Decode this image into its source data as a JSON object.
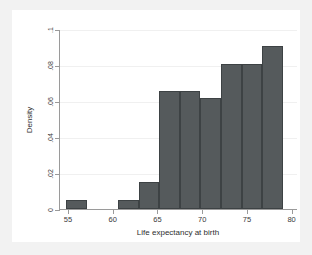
{
  "figure": {
    "background_color": "#f2f2f2",
    "plot_background_color": "#ffffff",
    "bar_color": "#555a5c",
    "bar_border_color": "#3d4244",
    "axis_color": "#9a9a9a",
    "grid_color": "#f0f0f0"
  },
  "chart_data": {
    "type": "bar",
    "title": "",
    "subtitle": "",
    "xlabel": "Life expectancy at birth",
    "ylabel": "Density",
    "xlim": [
      54.0,
      80.6
    ],
    "ylim": [
      0,
      0.1
    ],
    "grid": true,
    "legend": null,
    "legend_position": "none",
    "bin_width": 2.3,
    "xticks": [
      55,
      60,
      65,
      70,
      75,
      80
    ],
    "xtick_labels": [
      "55",
      "60",
      "65",
      "70",
      "75",
      "80"
    ],
    "yticks": [
      0,
      0.02,
      0.04,
      0.06,
      0.08,
      0.1
    ],
    "ytick_labels": [
      "0",
      ".02",
      ".04",
      ".06",
      ".08",
      ".1"
    ],
    "bars": [
      {
        "x_start": 54.8,
        "x_end": 57.1,
        "value": 0.005
      },
      {
        "x_start": 60.6,
        "x_end": 62.9,
        "value": 0.005
      },
      {
        "x_start": 62.9,
        "x_end": 65.2,
        "value": 0.015
      },
      {
        "x_start": 65.2,
        "x_end": 67.5,
        "value": 0.0655
      },
      {
        "x_start": 67.5,
        "x_end": 69.8,
        "value": 0.0655
      },
      {
        "x_start": 69.8,
        "x_end": 72.1,
        "value": 0.0615
      },
      {
        "x_start": 72.1,
        "x_end": 74.4,
        "value": 0.0805
      },
      {
        "x_start": 74.4,
        "x_end": 76.7,
        "value": 0.0805
      },
      {
        "x_start": 76.7,
        "x_end": 79.0,
        "value": 0.0905
      }
    ],
    "categories": [
      "54.8-57.1",
      "60.6-62.9",
      "62.9-65.2",
      "65.2-67.5",
      "67.5-69.8",
      "69.8-72.1",
      "72.1-74.4",
      "74.4-76.7",
      "76.7-79.0"
    ],
    "values": [
      0.005,
      0.005,
      0.015,
      0.0655,
      0.0655,
      0.0615,
      0.0805,
      0.0805,
      0.0905
    ]
  }
}
